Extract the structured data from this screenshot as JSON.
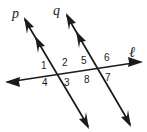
{
  "figure": {
    "background_color": "#fefefe",
    "stroke_color": "#1b1b1b"
  },
  "lines": [
    {
      "id": "line-p",
      "label": "p",
      "label_x": 12,
      "label_y": 7,
      "x1": 25,
      "y1": 20,
      "x2": 88,
      "y2": 126,
      "arrow_start": true,
      "arrow_end": true,
      "parallel_tick_marks": 1
    },
    {
      "id": "line-q",
      "label": "q",
      "label_x": 53,
      "label_y": 4,
      "x1": 67,
      "y1": 16,
      "x2": 130,
      "y2": 124,
      "arrow_start": true,
      "arrow_end": true,
      "parallel_tick_marks": 1
    },
    {
      "id": "line-l",
      "label": "ℓ",
      "label_x": 129,
      "label_y": 45,
      "x1": 8,
      "y1": 82,
      "x2": 140,
      "y2": 62,
      "arrow_start": true,
      "arrow_end": true,
      "parallel_tick_marks": 0
    }
  ],
  "intersections": [
    {
      "id": "intersection-p-l",
      "x": 62,
      "y": 78
    },
    {
      "id": "intersection-q-l",
      "x": 104,
      "y": 72
    }
  ],
  "angle_labels": [
    {
      "id": "angle-1",
      "text": "1",
      "x": 41,
      "y": 61,
      "position": "upper-left-of-p"
    },
    {
      "id": "angle-2",
      "text": "2",
      "x": 62,
      "y": 58,
      "position": "upper-right-of-p"
    },
    {
      "id": "angle-3",
      "text": "3",
      "x": 64,
      "y": 78,
      "position": "lower-right-of-p"
    },
    {
      "id": "angle-4",
      "text": "4",
      "x": 42,
      "y": 78,
      "position": "lower-left-of-p"
    },
    {
      "id": "angle-5",
      "text": "5",
      "x": 81,
      "y": 56,
      "position": "upper-left-of-q"
    },
    {
      "id": "angle-6",
      "text": "6",
      "x": 104,
      "y": 53,
      "position": "upper-right-of-q"
    },
    {
      "id": "angle-7",
      "text": "7",
      "x": 105,
      "y": 73,
      "position": "lower-right-of-q"
    },
    {
      "id": "angle-8",
      "text": "8",
      "x": 84,
      "y": 75,
      "position": "lower-left-of-q"
    }
  ]
}
